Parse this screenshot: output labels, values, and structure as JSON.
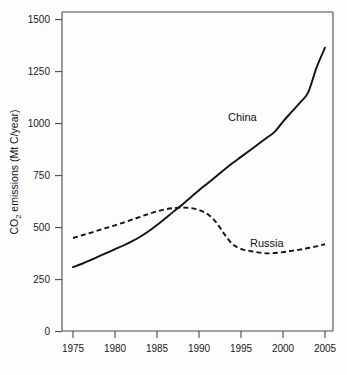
{
  "figure": {
    "name": "co2-emissions-china-russia-line-chart",
    "background_color": "#fdfdfd",
    "line_color": "#111111",
    "axis_color": "#4a4a4a"
  },
  "axes": {
    "y_title_part1": "CO",
    "y_title_sub": "2",
    "y_title_part2": " emissions (Mt C/year)",
    "y_title_full": "CO2 emissions (Mt C/year)",
    "x_title": "",
    "y_ticks": [
      "0",
      "250",
      "500",
      "750",
      "1000",
      "1250",
      "1500"
    ],
    "x_ticks": [
      "1975",
      "1980",
      "1985",
      "1990",
      "1995",
      "2000",
      "2005"
    ]
  },
  "labels": {
    "china": "China",
    "russia": "Russia"
  },
  "chart_data": {
    "type": "line",
    "title": "",
    "subtitle": "",
    "xlabel": "",
    "ylabel": "CO2 emissions (Mt C/year)",
    "xlim": [
      1975,
      2005
    ],
    "ylim": [
      0,
      1500
    ],
    "xticks": [
      1975,
      1980,
      1985,
      1990,
      1995,
      2000,
      2005
    ],
    "yticks": [
      0,
      250,
      500,
      750,
      1000,
      1250,
      1500
    ],
    "grid": false,
    "legend": "inline-annotations",
    "annotations": [
      {
        "text": "China",
        "x": 1992.5,
        "y": 1030
      },
      {
        "text": "Russia",
        "x": 1996.5,
        "y": 430
      }
    ],
    "series": [
      {
        "name": "China",
        "style": "solid",
        "color": "#111111",
        "x": [
          1975,
          1976,
          1977,
          1978,
          1979,
          1980,
          1981,
          1982,
          1983,
          1984,
          1985,
          1986,
          1987,
          1988,
          1989,
          1990,
          1991,
          1992,
          1993,
          1994,
          1995,
          1996,
          1997,
          1998,
          1999,
          2000,
          2001,
          2002,
          2003,
          2004,
          2005
        ],
        "values": [
          310,
          325,
          342,
          360,
          378,
          396,
          414,
          434,
          456,
          482,
          512,
          545,
          578,
          610,
          645,
          680,
          712,
          745,
          778,
          810,
          840,
          870,
          900,
          930,
          960,
          1010,
          1055,
          1100,
          1150,
          1270,
          1365
        ]
      },
      {
        "name": "Russia",
        "style": "dashed",
        "color": "#111111",
        "x": [
          1975,
          1976,
          1977,
          1978,
          1979,
          1980,
          1981,
          1982,
          1983,
          1984,
          1985,
          1986,
          1987,
          1988,
          1989,
          1990,
          1991,
          1992,
          1993,
          1994,
          1995,
          1996,
          1997,
          1998,
          1999,
          2000,
          2001,
          2002,
          2003,
          2004,
          2005
        ],
        "values": [
          450,
          462,
          474,
          487,
          499,
          511,
          524,
          538,
          552,
          566,
          578,
          588,
          594,
          596,
          594,
          585,
          565,
          528,
          470,
          420,
          398,
          388,
          381,
          376,
          378,
          382,
          388,
          394,
          402,
          410,
          420
        ]
      }
    ]
  }
}
